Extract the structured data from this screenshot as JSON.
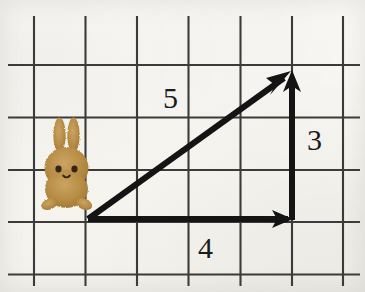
{
  "figure": {
    "background_color": "#f8f7f3",
    "ink_color": "#141414",
    "grid_line_color": "#3d3d3d"
  },
  "grid": {
    "columns": 7,
    "rows": 5,
    "cell_width": 51.5,
    "cell_height": 52.5,
    "vertical_line_x": [
      34,
      85.5,
      137,
      188.5,
      240.5,
      292,
      343
    ],
    "horizontal_line_y": [
      65,
      117.5,
      170,
      222,
      274.5
    ],
    "line_width": 2
  },
  "triangle": {
    "origin": {
      "x": 88,
      "y": 219
    },
    "corner_right": {
      "x": 292,
      "y": 219
    },
    "apex": {
      "x": 292,
      "y": 72
    },
    "vectors": [
      {
        "name": "horizontal-vector",
        "label": "4",
        "units": 4,
        "direction": "right",
        "from": {
          "x": 88,
          "y": 219
        },
        "to": {
          "x": 292,
          "y": 219
        },
        "arrowhead": true
      },
      {
        "name": "vertical-vector",
        "label": "3",
        "units": 3,
        "direction": "up",
        "from": {
          "x": 292,
          "y": 219
        },
        "to": {
          "x": 292,
          "y": 72
        },
        "arrowhead": true
      },
      {
        "name": "hypotenuse-vector",
        "label": "5",
        "units": 5,
        "direction": "up-right",
        "from": {
          "x": 88,
          "y": 219
        },
        "to": {
          "x": 292,
          "y": 72
        },
        "arrowhead": true
      }
    ],
    "stroke_width": 6
  },
  "labels": {
    "hypotenuse": "5",
    "vertical": "3",
    "horizontal": "4"
  },
  "rabbit": {
    "name": "rabbit-illustration",
    "body_color": "#b58b42",
    "body_color_light": "#cba462",
    "body_color_dark": "#9a7333",
    "eye_color": "#3a2a18",
    "position": {
      "x": 36,
      "y": 116,
      "width": 62,
      "height": 108
    }
  }
}
